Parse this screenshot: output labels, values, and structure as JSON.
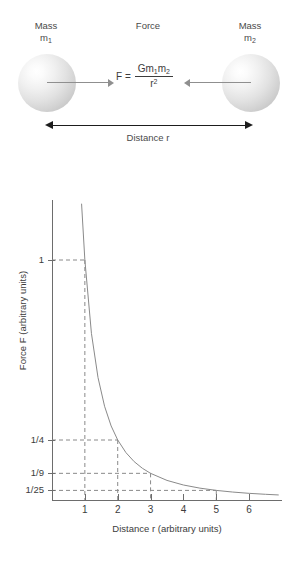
{
  "diagram": {
    "mass1": {
      "name": "Mass",
      "symbol": "m",
      "subscript": "1"
    },
    "mass2": {
      "name": "Mass",
      "symbol": "m",
      "subscript": "2"
    },
    "force_label": "Force",
    "formula": {
      "lhs": "F =",
      "numerator_prefix": "Gm",
      "numerator_sub1": "1",
      "numerator_mid": "m",
      "numerator_sub2": "2",
      "denominator": "r",
      "denominator_exp": "2"
    },
    "distance_label": "Distance r",
    "colors": {
      "sphere_light": "#ffffff",
      "sphere_dark": "#bdbdbd",
      "force_arrow": "#8f8f8f",
      "distance_arrow": "#1d1d1d"
    }
  },
  "chart_data": {
    "type": "line",
    "title": "",
    "xlabel": "Distance r (arbitrary units)",
    "ylabel": "Force F (arbitrary units)",
    "xlim": [
      0,
      7
    ],
    "ylim": [
      0,
      1.25
    ],
    "grid": false,
    "legend": null,
    "x_ticks": [
      1,
      2,
      3,
      4,
      5,
      6
    ],
    "x_tick_labels": [
      "1",
      "2",
      "3",
      "4",
      "5",
      "6"
    ],
    "y_ticks": [
      1,
      0.25,
      0.1111,
      0.04
    ],
    "y_tick_labels": [
      "1",
      "1/4",
      "1/9",
      "1/25"
    ],
    "series": [
      {
        "name": "F = 1/r^2",
        "x": [
          0.9,
          1.0,
          1.2,
          1.4,
          1.6,
          1.8,
          2.0,
          2.25,
          2.5,
          2.75,
          3.0,
          3.5,
          4.0,
          4.5,
          5.0,
          5.5,
          6.0,
          6.5,
          6.9
        ],
        "y": [
          1.2346,
          1.0,
          0.6944,
          0.5102,
          0.3906,
          0.3086,
          0.25,
          0.1975,
          0.16,
          0.1322,
          0.1111,
          0.0816,
          0.0625,
          0.0494,
          0.04,
          0.0331,
          0.0278,
          0.0237,
          0.021
        ]
      }
    ],
    "annotations": [
      {
        "label": "r=1, F=1",
        "x": 1,
        "y": 1.0,
        "style": "dashed-guide"
      },
      {
        "label": "r=2, F=1/4",
        "x": 2,
        "y": 0.25,
        "style": "dashed-guide"
      },
      {
        "label": "r=3, F=1/9",
        "x": 3,
        "y": 0.1111,
        "style": "dashed-guide"
      },
      {
        "label": "r=5, F=1/25",
        "x": 5,
        "y": 0.04,
        "style": "dashed-guide"
      }
    ],
    "line_color": "#8a8a8a",
    "guide_color": "#8a8a8a",
    "axis_color": "#6d6d6d"
  }
}
